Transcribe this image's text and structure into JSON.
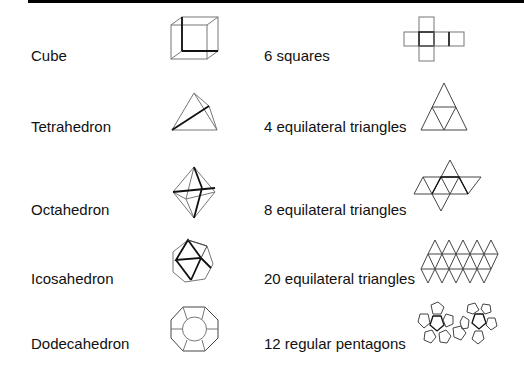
{
  "rows": [
    {
      "solid": "Cube",
      "faces": "6 squares",
      "solid_icon": "cube-icon",
      "net_icon": "cube-net-icon"
    },
    {
      "solid": "Tetrahedron",
      "faces": "4 equilateral triangles",
      "solid_icon": "tetrahedron-icon",
      "net_icon": "tetrahedron-net-icon"
    },
    {
      "solid": "Octahedron",
      "faces": "8 equilateral triangles",
      "solid_icon": "octahedron-icon",
      "net_icon": "octahedron-net-icon"
    },
    {
      "solid": "Icosahedron",
      "faces": "20 equilateral triangles",
      "solid_icon": "icosahedron-icon",
      "net_icon": "icosahedron-net-icon"
    },
    {
      "solid": "Dodecahedron",
      "faces": "12 regular pentagons",
      "solid_icon": "dodecahedron-icon",
      "net_icon": "dodecahedron-net-icon"
    }
  ]
}
